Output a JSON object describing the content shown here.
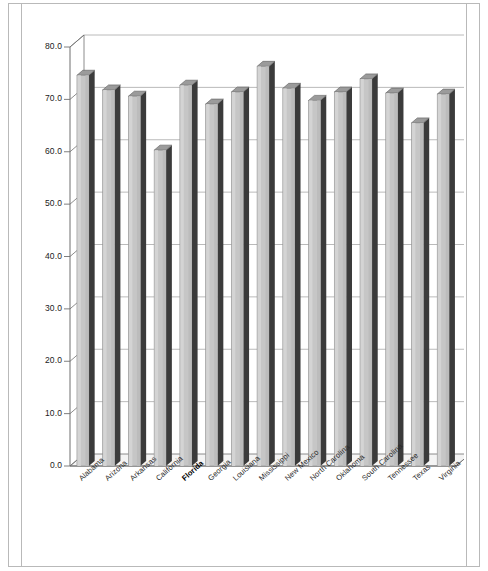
{
  "chart_data": {
    "type": "bar",
    "title": "",
    "subtitle": "",
    "xlabel": "",
    "ylabel": "",
    "ylim": [
      0,
      80
    ],
    "ytick_step": 10,
    "grid": true,
    "legend": null,
    "style": "3d-column",
    "highlighted_category": "Florida",
    "categories": [
      "Alabama",
      "Arizona",
      "Arkansas",
      "California",
      "Florida",
      "Georgia",
      "Louisiana",
      "Mississippi",
      "New Mexico",
      "North Carolina",
      "Oklahoma",
      "South Carolina",
      "Tennessee",
      "Texas",
      "Virginia"
    ],
    "values": [
      74.6,
      71.8,
      70.6,
      60.3,
      72.7,
      69.1,
      71.4,
      76.3,
      72.1,
      69.8,
      71.4,
      73.9,
      71.2,
      65.5,
      71.0
    ],
    "ytick_labels": [
      "0.0",
      "10.0",
      "20.0",
      "30.0",
      "40.0",
      "50.0",
      "60.0",
      "70.0",
      "80.0"
    ],
    "ytick_values": [
      0,
      10,
      20,
      30,
      40,
      50,
      60,
      70,
      80
    ],
    "colors": {
      "bar_face": "#c6c6c6",
      "bar_side": "#3b3b3b",
      "bar_top": "#6d6d6d",
      "grid": "#a8a8a8",
      "axis": "#6f6f6f",
      "frame": "#b9b9b9",
      "text": "#1b1b1b"
    }
  }
}
